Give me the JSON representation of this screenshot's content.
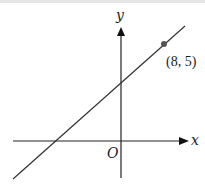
{
  "diagram": {
    "type": "coordinate-graph",
    "axes": {
      "x_label": "x",
      "y_label": "y",
      "origin_label": "O"
    },
    "line": {
      "description": "straight line with positive gradient, positive y-intercept, negative x-intercept",
      "color": "#333333"
    },
    "point": {
      "label": "(8, 5)",
      "x": 8,
      "y": 5,
      "color": "#444444"
    }
  }
}
